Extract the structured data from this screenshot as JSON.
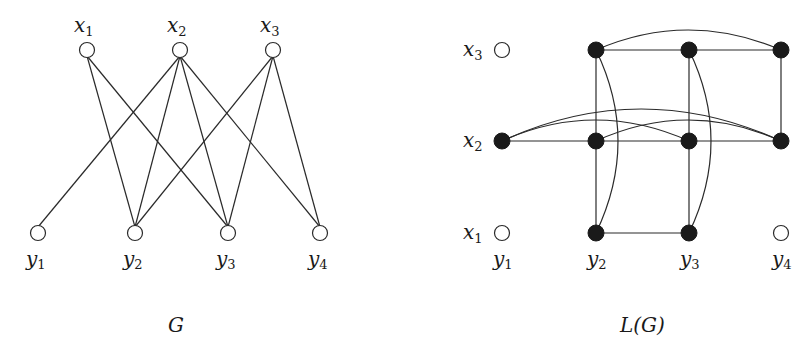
{
  "graph_G": {
    "caption": "G",
    "top_nodes": [
      {
        "id": "x1",
        "base": "x",
        "sub": "1",
        "cx": 87,
        "cy": 50
      },
      {
        "id": "x2",
        "base": "x",
        "sub": "2",
        "cx": 180,
        "cy": 50
      },
      {
        "id": "x3",
        "base": "x",
        "sub": "3",
        "cx": 273,
        "cy": 50
      }
    ],
    "bottom_nodes": [
      {
        "id": "y1",
        "base": "y",
        "sub": "1",
        "cx": 38,
        "cy": 233
      },
      {
        "id": "y2",
        "base": "y",
        "sub": "2",
        "cx": 135,
        "cy": 233
      },
      {
        "id": "y3",
        "base": "y",
        "sub": "3",
        "cx": 228,
        "cy": 233
      },
      {
        "id": "y4",
        "base": "y",
        "sub": "4",
        "cx": 320,
        "cy": 233
      }
    ],
    "edges": [
      [
        "x1",
        "y2"
      ],
      [
        "x1",
        "y3"
      ],
      [
        "x2",
        "y1"
      ],
      [
        "x2",
        "y2"
      ],
      [
        "x2",
        "y3"
      ],
      [
        "x2",
        "y4"
      ],
      [
        "x3",
        "y2"
      ],
      [
        "x3",
        "y3"
      ],
      [
        "x3",
        "y4"
      ]
    ]
  },
  "graph_LG": {
    "caption": "L(G)",
    "row_labels": [
      {
        "base": "x",
        "sub": "3",
        "y": 50
      },
      {
        "base": "x",
        "sub": "2",
        "y": 141
      },
      {
        "base": "x",
        "sub": "1",
        "y": 233
      }
    ],
    "col_labels": [
      {
        "base": "y",
        "sub": "1",
        "x": 502
      },
      {
        "base": "y",
        "sub": "2",
        "x": 596
      },
      {
        "base": "y",
        "sub": "3",
        "x": 689
      },
      {
        "base": "y",
        "sub": "4",
        "x": 781
      }
    ],
    "open_nodes": [
      {
        "id": "x3y1",
        "cx": 502,
        "cy": 50
      },
      {
        "id": "x1y1",
        "cx": 502,
        "cy": 233
      },
      {
        "id": "x1y4",
        "cx": 781,
        "cy": 233
      }
    ],
    "filled_nodes": [
      {
        "id": "x3y2",
        "cx": 596,
        "cy": 50
      },
      {
        "id": "x3y3",
        "cx": 689,
        "cy": 50
      },
      {
        "id": "x3y4",
        "cx": 781,
        "cy": 50
      },
      {
        "id": "x2y1",
        "cx": 502,
        "cy": 141
      },
      {
        "id": "x2y2",
        "cx": 596,
        "cy": 141
      },
      {
        "id": "x2y3",
        "cx": 689,
        "cy": 141
      },
      {
        "id": "x2y4",
        "cx": 781,
        "cy": 141
      },
      {
        "id": "x1y2",
        "cx": 596,
        "cy": 233
      },
      {
        "id": "x1y3",
        "cx": 689,
        "cy": 233
      }
    ],
    "edges": [
      {
        "from": "x3y2",
        "to": "x3y3",
        "type": "straight"
      },
      {
        "from": "x3y3",
        "to": "x3y4",
        "type": "straight"
      },
      {
        "from": "x3y2",
        "to": "x3y4",
        "type": "arc"
      },
      {
        "from": "x2y1",
        "to": "x2y2",
        "type": "straight"
      },
      {
        "from": "x2y2",
        "to": "x2y3",
        "type": "straight"
      },
      {
        "from": "x2y3",
        "to": "x2y4",
        "type": "straight"
      },
      {
        "from": "x2y1",
        "to": "x2y3",
        "type": "arc"
      },
      {
        "from": "x2y1",
        "to": "x2y4",
        "type": "arc"
      },
      {
        "from": "x2y2",
        "to": "x2y4",
        "type": "arc"
      },
      {
        "from": "x1y2",
        "to": "x1y3",
        "type": "straight"
      },
      {
        "from": "x3y2",
        "to": "x2y2",
        "type": "straight"
      },
      {
        "from": "x2y2",
        "to": "x1y2",
        "type": "straight"
      },
      {
        "from": "x3y2",
        "to": "x1y2",
        "type": "arc"
      },
      {
        "from": "x3y3",
        "to": "x2y3",
        "type": "straight"
      },
      {
        "from": "x2y3",
        "to": "x1y3",
        "type": "straight"
      },
      {
        "from": "x3y3",
        "to": "x1y3",
        "type": "arc"
      },
      {
        "from": "x3y4",
        "to": "x2y4",
        "type": "straight"
      }
    ]
  },
  "colors": {
    "line": "#2a2a2a",
    "filled_node": "#1a1a1a",
    "background": "#ffffff"
  }
}
